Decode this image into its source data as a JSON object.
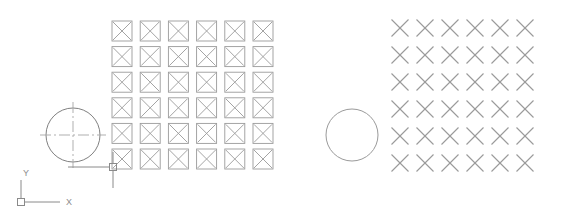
{
  "canvas": {
    "width": 567,
    "height": 216,
    "background_color": "#ffffff",
    "line_color": "#9a9a9a",
    "line_color_dark": "#808080",
    "centerline_color": "#a6a6a6",
    "cursor_color": "#8a8a8a"
  },
  "ucs_icon": {
    "name": "UCS axis icon",
    "origin": {
      "x": 21,
      "y": 202
    },
    "x_axis_label": "X",
    "y_axis_label": "Y",
    "x_axis_label_pos": {
      "x": 66,
      "y": 205
    },
    "y_axis_label_pos": {
      "x": 23,
      "y": 176
    },
    "x_axis_end": {
      "x": 60,
      "y": 202
    },
    "y_axis_end": {
      "x": 21,
      "y": 180
    },
    "box_size": 7
  },
  "source_circle": {
    "name": "source circle with centerlines",
    "center": {
      "x": 73,
      "y": 135
    },
    "radius": 27,
    "has_centerlines": true,
    "centerline_overhang": 6
  },
  "target_circle": {
    "name": "array result circle",
    "center": {
      "x": 352,
      "y": 135
    },
    "radius": 26,
    "has_centerlines": false
  },
  "square_array": {
    "name": "rectangular array of crossed squares",
    "columns": 6,
    "rows": 6,
    "cell_size": 20,
    "col_pitch": 28.2,
    "row_pitch": 25.6,
    "origin": {
      "x": 112,
      "y": 21
    },
    "glyph": "crossed-square"
  },
  "x_array": {
    "name": "rectangular array of X marks",
    "columns": 6,
    "rows": 6,
    "mark_size": 17,
    "col_pitch": 25.0,
    "row_pitch": 27.0,
    "center_origin": {
      "x": 400,
      "y": 28
    },
    "glyph": "x-mark"
  },
  "crosshair_cursor": {
    "name": "crosshair pick cursor",
    "center": {
      "x": 113,
      "y": 167
    },
    "pick_box_size": 7,
    "horizontal_tail_left": 68,
    "vertical_tail_down": 188,
    "vertical_tail_up": 152
  }
}
